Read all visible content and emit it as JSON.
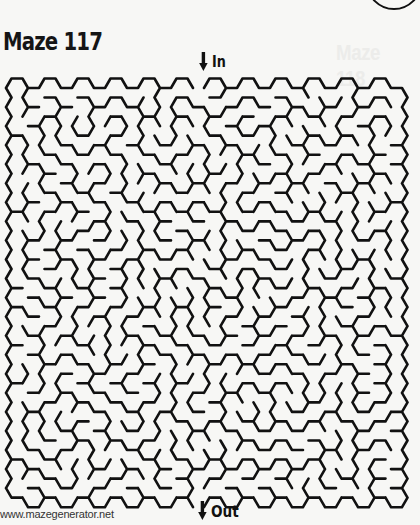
{
  "page": {
    "title": "Maze 117",
    "ghost_title": "Maze 118",
    "entrance_label": "In",
    "exit_label": "Out",
    "credit": "www.mazegenerator.net"
  },
  "maze": {
    "type": "hexagonal",
    "columns": 24,
    "rows": 22,
    "line_color": "#111111",
    "background_color": "#f7f7f5",
    "entrance_column": 11,
    "exit_column": 11
  }
}
